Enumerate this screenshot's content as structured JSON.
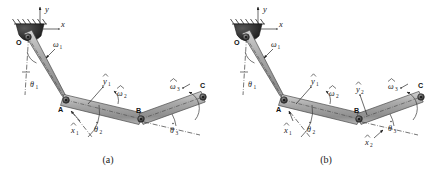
{
  "figure": {
    "type": "mechanism-kinematic-diagram",
    "background_color": "#ffffff",
    "link_color": "#a8a8a8",
    "link_edge_color": "#4a4a4a",
    "joint_color": "#3a3a3a",
    "ground_color": "#2b2b2b",
    "text_color": "#1b1b1b"
  },
  "panels": [
    {
      "id": "a",
      "caption": "(a)",
      "joints": [
        {
          "name": "O",
          "label": "O",
          "x": 28,
          "y": 37
        },
        {
          "name": "A",
          "label": "A",
          "x": 66,
          "y": 100
        },
        {
          "name": "B",
          "label": "B",
          "x": 141,
          "y": 119
        },
        {
          "name": "C",
          "label": "C",
          "x": 203,
          "y": 97
        }
      ],
      "labels": [
        {
          "name": "y-axis-label",
          "text": "y",
          "sub": "",
          "hat": false,
          "x": 45,
          "y": 10
        },
        {
          "name": "x-axis-label",
          "text": "x",
          "sub": "",
          "hat": false,
          "x": 62,
          "y": 31
        },
        {
          "name": "omega1-label",
          "text": "ω",
          "sub": "1",
          "hat": false,
          "x": 51,
          "y": 44
        },
        {
          "name": "theta1-label",
          "text": "θ",
          "sub": "1",
          "hat": false,
          "x": 32,
          "y": 84
        },
        {
          "name": "yhat1-label",
          "text": "y",
          "sub": "1",
          "hat": true,
          "x": 105,
          "y": 83
        },
        {
          "name": "xhat1-label",
          "text": "x",
          "sub": "1",
          "hat": true,
          "x": 73,
          "y": 130
        },
        {
          "name": "theta2-label",
          "text": "θ",
          "sub": "2",
          "hat": true,
          "x": 96,
          "y": 129
        },
        {
          "name": "omegahat2-label",
          "text": "ω",
          "sub": "2",
          "hat": true,
          "x": 120,
          "y": 95
        },
        {
          "name": "theta3-label",
          "text": "θ",
          "sub": "3",
          "hat": true,
          "x": 172,
          "y": 131
        },
        {
          "name": "omegahat3-label",
          "text": "ω",
          "sub": "3",
          "hat": true,
          "x": 173,
          "y": 87
        }
      ]
    },
    {
      "id": "b",
      "caption": "(b)",
      "joints": [
        {
          "name": "O",
          "label": "O",
          "x": 246,
          "y": 37
        },
        {
          "name": "A",
          "label": "A",
          "x": 284,
          "y": 100
        },
        {
          "name": "B",
          "label": "B",
          "x": 359,
          "y": 119
        },
        {
          "name": "C",
          "label": "C",
          "x": 421,
          "y": 97
        }
      ],
      "labels": [
        {
          "name": "y-axis-label",
          "text": "y",
          "sub": "",
          "hat": false,
          "x": 263,
          "y": 10
        },
        {
          "name": "x-axis-label",
          "text": "x",
          "sub": "",
          "hat": false,
          "x": 280,
          "y": 31
        },
        {
          "name": "omega1-label",
          "text": "ω",
          "sub": "1",
          "hat": false,
          "x": 269,
          "y": 44
        },
        {
          "name": "theta1-label",
          "text": "θ",
          "sub": "1",
          "hat": false,
          "x": 250,
          "y": 84
        },
        {
          "name": "yhat1-label",
          "text": "y",
          "sub": "1",
          "hat": true,
          "x": 313,
          "y": 83
        },
        {
          "name": "xhat1-label",
          "text": "x",
          "sub": "1",
          "hat": true,
          "x": 286,
          "y": 130
        },
        {
          "name": "theta2-label",
          "text": "θ",
          "sub": "2",
          "hat": true,
          "x": 309,
          "y": 129
        },
        {
          "name": "omegahat2-label",
          "text": "ω",
          "sub": "2",
          "hat": true,
          "x": 332,
          "y": 95
        },
        {
          "name": "yhat2-label",
          "text": "y",
          "sub": "2",
          "hat": true,
          "x": 358,
          "y": 90
        },
        {
          "name": "xhat2-label",
          "text": "x",
          "sub": "2",
          "hat": true,
          "x": 367,
          "y": 142
        },
        {
          "name": "theta3-label",
          "text": "θ",
          "sub": "3",
          "hat": true,
          "x": 391,
          "y": 128
        },
        {
          "name": "omegahat3-label",
          "text": "ω",
          "sub": "3",
          "hat": true,
          "x": 391,
          "y": 87
        }
      ]
    }
  ]
}
